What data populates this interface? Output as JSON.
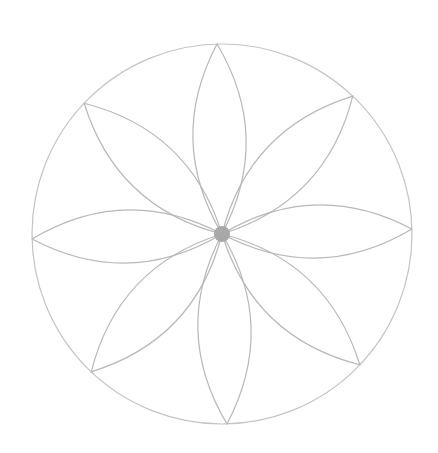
{
  "diagram": {
    "type": "eight-petal flower in circle",
    "center": [
      222,
      234
    ],
    "radius": 190,
    "petal_count": 8,
    "rotation_deg": -1.5,
    "stroke_color": "#b8b8b8",
    "center_dot_color": "#a8a8a8",
    "background": "#ffffff"
  }
}
